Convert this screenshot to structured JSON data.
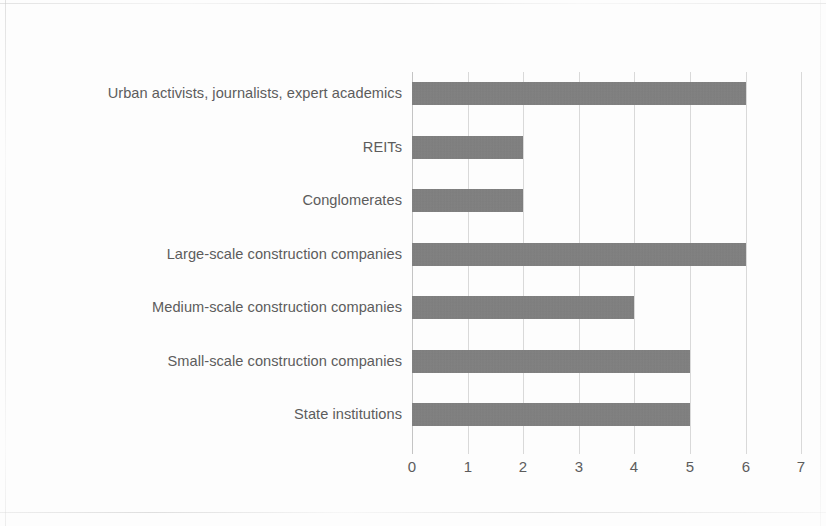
{
  "chart_data": {
    "type": "bar",
    "orientation": "horizontal",
    "title": "",
    "subtitle": "",
    "xlabel": "",
    "ylabel": "",
    "categories": [
      "Urban activists, journalists, expert academics",
      "REITs",
      "Conglomerates",
      "Large-scale construction companies",
      "Medium-scale construction companies",
      "Small-scale construction companies",
      "State institutions"
    ],
    "values": [
      6,
      2,
      2,
      6,
      4,
      5,
      5
    ],
    "xlim": [
      0,
      7
    ],
    "x_ticks": [
      "0",
      "1",
      "2",
      "3",
      "4",
      "5",
      "6",
      "7"
    ],
    "x_tick_values": [
      0,
      1,
      2,
      3,
      4,
      5,
      6,
      7
    ],
    "grid": true,
    "grid_axis": "x",
    "legend": false,
    "legend_position": "none",
    "bar_color": "#808080",
    "gridline_color": "#d9d9d9",
    "label_color": "#5c5c5c",
    "background_color": "#fdfdfd"
  }
}
